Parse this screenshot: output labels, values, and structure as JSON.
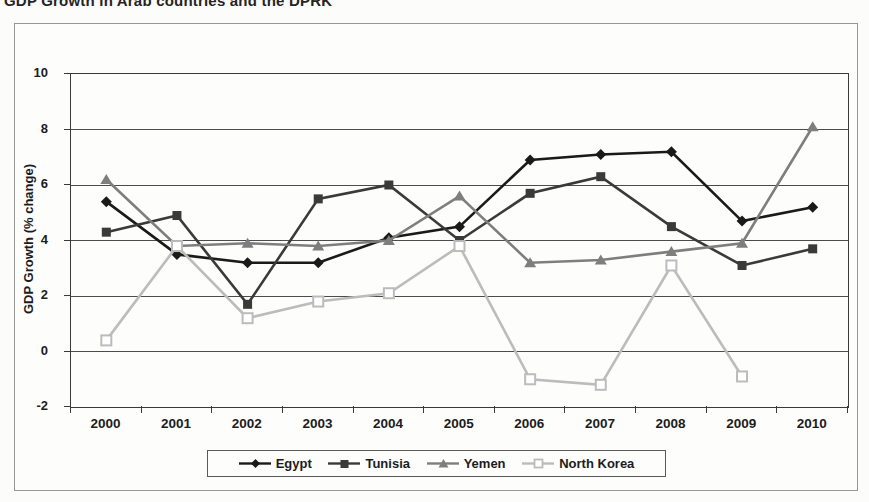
{
  "title": {
    "text": "GDP Growth in Arab countries and the DPRK"
  },
  "chart_data": {
    "type": "line",
    "title": "GDP Growth in Arab countries and the DPRK",
    "xlabel": "",
    "ylabel": "GDP Growth (% change)",
    "ylim": [
      -2,
      10
    ],
    "yticks": [
      10,
      8,
      6,
      4,
      2,
      0,
      -2
    ],
    "grid": true,
    "legend_position": "bottom",
    "categories": [
      "2000",
      "2001",
      "2002",
      "2003",
      "2004",
      "2005",
      "2006",
      "2007",
      "2008",
      "2009",
      "2010"
    ],
    "series": [
      {
        "name": "Egypt",
        "marker": "diamond",
        "color": "#1a1a1a",
        "values": [
          5.4,
          3.5,
          3.2,
          3.2,
          4.1,
          4.5,
          6.9,
          7.1,
          7.2,
          4.7,
          5.2
        ]
      },
      {
        "name": "Tunisia",
        "marker": "square",
        "color": "#3a3a3a",
        "values": [
          4.3,
          4.9,
          1.7,
          5.5,
          6.0,
          4.0,
          5.7,
          6.3,
          4.5,
          3.1,
          3.7
        ]
      },
      {
        "name": "Yemen",
        "marker": "triangle",
        "color": "#7e7e7e",
        "values": [
          6.2,
          3.8,
          3.9,
          3.8,
          4.0,
          5.6,
          3.2,
          3.3,
          3.6,
          3.9,
          8.1
        ]
      },
      {
        "name": "North Korea",
        "marker": "open-square",
        "color": "#bcbcbc",
        "values": [
          0.4,
          3.8,
          1.2,
          1.8,
          2.1,
          3.8,
          -1.0,
          -1.2,
          3.1,
          -0.9,
          null
        ]
      }
    ]
  }
}
